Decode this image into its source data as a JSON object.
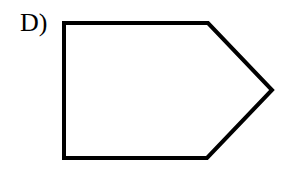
{
  "option_label": "D)",
  "shape": {
    "name": "pentagon",
    "stroke": "#000000",
    "fill": "#ffffff",
    "stroke_width": 4,
    "points": "64,23 208,23 272,90 207,158 64,158"
  }
}
